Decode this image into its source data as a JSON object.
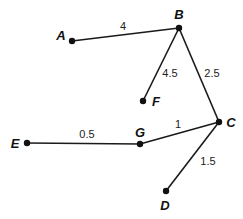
{
  "diagram": {
    "type": "weighted-graph",
    "nodes": [
      {
        "id": "A",
        "label": "A",
        "x": 72,
        "y": 41,
        "lx": 61,
        "ly": 40
      },
      {
        "id": "B",
        "label": "B",
        "x": 179,
        "y": 28,
        "lx": 179,
        "ly": 19
      },
      {
        "id": "F",
        "label": "F",
        "x": 143,
        "y": 101,
        "lx": 156,
        "ly": 106
      },
      {
        "id": "C",
        "label": "C",
        "x": 219,
        "y": 122,
        "lx": 231,
        "ly": 127
      },
      {
        "id": "G",
        "label": "G",
        "x": 140,
        "y": 144,
        "lx": 140,
        "ly": 137
      },
      {
        "id": "E",
        "label": "E",
        "x": 27,
        "y": 143,
        "lx": 15,
        "ly": 148
      },
      {
        "id": "D",
        "label": "D",
        "x": 166,
        "y": 191,
        "lx": 165,
        "ly": 210
      }
    ],
    "edges": [
      {
        "from": "A",
        "to": "B",
        "weight": "4",
        "wx": 123,
        "wy": 30
      },
      {
        "from": "B",
        "to": "F",
        "weight": "4.5",
        "wx": 170,
        "wy": 77
      },
      {
        "from": "B",
        "to": "C",
        "weight": "2.5",
        "wx": 212,
        "wy": 77
      },
      {
        "from": "E",
        "to": "G",
        "weight": "0.5",
        "wx": 87,
        "wy": 138
      },
      {
        "from": "G",
        "to": "C",
        "weight": "1",
        "wx": 178,
        "wy": 128
      },
      {
        "from": "C",
        "to": "D",
        "weight": "1.5",
        "wx": 208,
        "wy": 165
      }
    ]
  }
}
